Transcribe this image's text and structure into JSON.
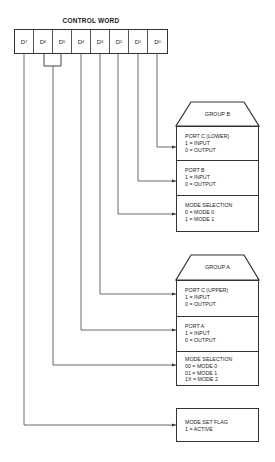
{
  "title": "CONTROL WORD",
  "control_word": {
    "bits": [
      {
        "name": "D",
        "sub": "7"
      },
      {
        "name": "D",
        "sub": "6"
      },
      {
        "name": "D",
        "sub": "5"
      },
      {
        "name": "D",
        "sub": "4"
      },
      {
        "name": "D",
        "sub": "3"
      },
      {
        "name": "D",
        "sub": "2"
      },
      {
        "name": "D",
        "sub": "1"
      },
      {
        "name": "D",
        "sub": "0"
      }
    ]
  },
  "group_b": {
    "header": "GROUP B",
    "sections": [
      {
        "title": "PORT C (LOWER)",
        "lines": [
          "1 = INPUT",
          "0 = OUTPUT"
        ]
      },
      {
        "title": "PORT B",
        "lines": [
          "1 = INPUT",
          "0 = OUTPUT"
        ]
      },
      {
        "title": "MODE SELECTION",
        "lines": [
          "0 = MODE 0",
          "1 = MODE 1"
        ]
      }
    ]
  },
  "group_a": {
    "header": "GROUP A",
    "sections": [
      {
        "title": "PORT C (UPPER)",
        "lines": [
          "1 = INPUT",
          "0 = OUTPUT"
        ]
      },
      {
        "title": "PORT A",
        "lines": [
          "1 = INPUT",
          "0 = OUTPUT"
        ]
      },
      {
        "title": "MODE SELECTION",
        "lines": [
          "00 = MODE 0",
          "01 = MODE 1",
          "1X = MODE 2"
        ]
      }
    ]
  },
  "mode_set_flag": {
    "title": "MODE SET FLAG",
    "lines": [
      "1 = ACTIVE"
    ]
  }
}
